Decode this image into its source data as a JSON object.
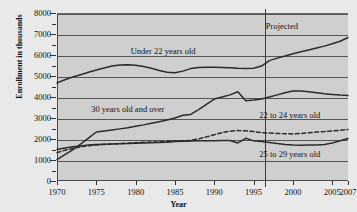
{
  "chart_data": {
    "type": "line",
    "title": "",
    "xlabel": "Year",
    "ylabel": "Enrollment in thousands",
    "xlim": [
      1970,
      2007
    ],
    "ylim": [
      0,
      8000
    ],
    "grid": true,
    "legend": "inline-annotations",
    "y_ticks": [
      0,
      1000,
      2000,
      3000,
      4000,
      5000,
      6000,
      7000,
      8000
    ],
    "y_minor_ticks": [
      500,
      1500,
      2500,
      3500,
      4500,
      5500,
      6500,
      7500
    ],
    "x_ticks": [
      1970,
      1975,
      1980,
      1985,
      1990,
      1995,
      2000,
      2005,
      2007
    ],
    "annotations": [
      {
        "text": "Under 22 years old",
        "x": 1983.5,
        "y": 6250
      },
      {
        "text": "Projected",
        "x": 1998.6,
        "y": 7450
      },
      {
        "text": "30 years old and over",
        "x": 1979.0,
        "y": 3500
      },
      {
        "text": "22 to 24 years old",
        "x": 1999.6,
        "y": 3180
      },
      {
        "text": "25 to 29 years old",
        "x": 1999.6,
        "y": 1320
      }
    ],
    "projection_divider_year": 1996.5,
    "series": [
      {
        "name": "Under 22 years old",
        "style": "solid",
        "x": [
          1970,
          1971,
          1972,
          1973,
          1974,
          1975,
          1976,
          1977,
          1978,
          1979,
          1980,
          1981,
          1982,
          1983,
          1984,
          1985,
          1986,
          1987,
          1988,
          1989,
          1990,
          1991,
          1992,
          1993,
          1994,
          1995,
          1996,
          1997,
          1998,
          1999,
          2000,
          2001,
          2002,
          2003,
          2004,
          2005,
          2006,
          2007
        ],
        "values": [
          4720,
          4870,
          5000,
          5110,
          5230,
          5330,
          5430,
          5520,
          5570,
          5580,
          5560,
          5500,
          5420,
          5310,
          5230,
          5200,
          5280,
          5400,
          5450,
          5460,
          5460,
          5450,
          5440,
          5420,
          5410,
          5420,
          5520,
          5780,
          5900,
          6000,
          6110,
          6200,
          6290,
          6380,
          6470,
          6580,
          6700,
          6880
        ]
      },
      {
        "name": "30 years old and over",
        "style": "solid",
        "x": [
          1970,
          1971,
          1972,
          1973,
          1974,
          1975,
          1976,
          1977,
          1978,
          1979,
          1980,
          1981,
          1982,
          1983,
          1984,
          1985,
          1986,
          1987,
          1988,
          1989,
          1990,
          1991,
          1992,
          1993,
          1994,
          1995,
          1996,
          1997,
          1998,
          1999,
          2000,
          2001,
          2002,
          2003,
          2004,
          2005,
          2006,
          2007
        ],
        "values": [
          1070,
          1300,
          1530,
          1800,
          2090,
          2380,
          2430,
          2480,
          2530,
          2580,
          2650,
          2720,
          2800,
          2870,
          2950,
          3050,
          3180,
          3220,
          3450,
          3700,
          3950,
          4050,
          4150,
          4300,
          3870,
          3900,
          3950,
          4050,
          4150,
          4250,
          4330,
          4330,
          4300,
          4250,
          4200,
          4170,
          4140,
          4120
        ]
      },
      {
        "name": "22 to 24 years old",
        "style": "dashed",
        "x": [
          1970,
          1971,
          1972,
          1973,
          1974,
          1975,
          1976,
          1977,
          1978,
          1979,
          1980,
          1981,
          1982,
          1983,
          1984,
          1985,
          1986,
          1987,
          1988,
          1989,
          1990,
          1991,
          1992,
          1993,
          1994,
          1995,
          1996,
          1997,
          1998,
          1999,
          2000,
          2001,
          2002,
          2003,
          2004,
          2005,
          2006,
          2007
        ],
        "values": [
          1400,
          1510,
          1600,
          1680,
          1730,
          1760,
          1790,
          1810,
          1830,
          1850,
          1870,
          1890,
          1900,
          1910,
          1930,
          1950,
          1960,
          1980,
          2050,
          2150,
          2250,
          2350,
          2420,
          2450,
          2440,
          2400,
          2350,
          2330,
          2310,
          2300,
          2290,
          2310,
          2340,
          2380,
          2400,
          2430,
          2460,
          2500
        ]
      },
      {
        "name": "25 to 29 years old",
        "style": "solid",
        "x": [
          1970,
          1971,
          1972,
          1973,
          1974,
          1975,
          1976,
          1977,
          1978,
          1979,
          1980,
          1981,
          1982,
          1983,
          1984,
          1985,
          1986,
          1987,
          1988,
          1989,
          1990,
          1991,
          1992,
          1993,
          1994,
          1995,
          1996,
          1997,
          1998,
          1999,
          2000,
          2001,
          2002,
          2003,
          2004,
          2005,
          2006,
          2007
        ],
        "values": [
          1550,
          1620,
          1680,
          1720,
          1760,
          1790,
          1800,
          1810,
          1820,
          1830,
          1850,
          1860,
          1870,
          1880,
          1890,
          1930,
          1940,
          1950,
          1960,
          1965,
          1970,
          1975,
          1975,
          1860,
          2080,
          1960,
          1930,
          1880,
          1830,
          1790,
          1760,
          1750,
          1760,
          1760,
          1790,
          1860,
          1960,
          2070
        ]
      }
    ]
  }
}
